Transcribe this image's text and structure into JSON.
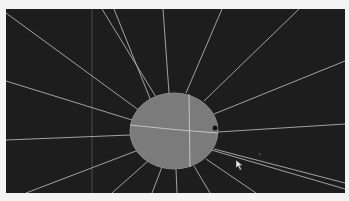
{
  "app": {
    "view": "3d-viewport",
    "background_color": "#1d1d1d",
    "page_background_color": "#f4f4f4"
  },
  "scene": {
    "object": "sphere",
    "object_color": "#7b7b7b",
    "ray_color": "#b9b9b9",
    "ray_count": 18,
    "icons": {
      "cursor": "mouse-pointer-icon"
    }
  }
}
